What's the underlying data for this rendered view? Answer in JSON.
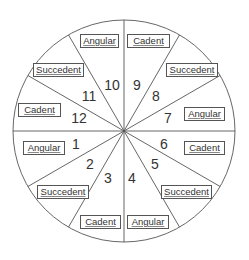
{
  "diagram": {
    "type": "house-wheel",
    "center": [
      124,
      131
    ],
    "radius": 111,
    "spoke_count": 12,
    "colors": {
      "line": "#555555",
      "text": "#333333",
      "background": "#ffffff"
    },
    "houses": [
      {
        "number": "1",
        "type": "Angular"
      },
      {
        "number": "2",
        "type": "Succedent"
      },
      {
        "number": "3",
        "type": "Cadent"
      },
      {
        "number": "4",
        "type": "Angular"
      },
      {
        "number": "5",
        "type": "Succedent"
      },
      {
        "number": "6",
        "type": "Cadent"
      },
      {
        "number": "7",
        "type": "Angular"
      },
      {
        "number": "8",
        "type": "Succedent"
      },
      {
        "number": "9",
        "type": "Cadent"
      },
      {
        "number": "10",
        "type": "Angular"
      },
      {
        "number": "11",
        "type": "Succedent"
      },
      {
        "number": "12",
        "type": "Cadent"
      }
    ]
  }
}
